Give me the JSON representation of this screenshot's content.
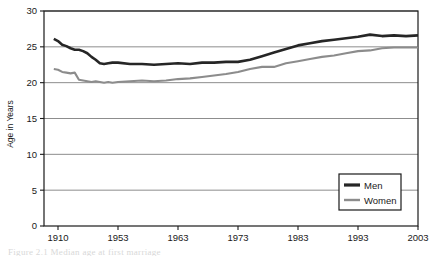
{
  "figure": {
    "background": "#ffffff",
    "caption_partial": "Figure 2.1  Median age at first marriage"
  },
  "chart_data": {
    "type": "line",
    "title": "",
    "subtitle": "",
    "xlabel": "",
    "ylabel": "Age in Years",
    "ylim": [
      0,
      30
    ],
    "yticks": [
      0,
      5,
      10,
      15,
      20,
      25,
      30
    ],
    "ytick_labels": [
      "0",
      "5",
      "10",
      "15",
      "20",
      "25",
      "30"
    ],
    "xticks": [
      1910,
      1953,
      1963,
      1973,
      1983,
      1993,
      2003
    ],
    "xtick_labels": [
      "1910",
      "1953",
      "1963",
      "1973",
      "1983",
      "1993",
      "2003"
    ],
    "xlim": [
      1907,
      2003
    ],
    "grid": "horizontal",
    "legend_position": "bottom-right",
    "colors": {
      "men": "#262626",
      "women": "#8c8c8c",
      "axis": "#1a1a1a",
      "gridline": "#808080",
      "plot_border": "#1a1a1a"
    },
    "x": [
      1907,
      1910,
      1913,
      1916,
      1919,
      1922,
      1925,
      1928,
      1931,
      1934,
      1937,
      1940,
      1943,
      1946,
      1949,
      1953,
      1955,
      1957,
      1959,
      1961,
      1963,
      1965,
      1967,
      1969,
      1971,
      1973,
      1975,
      1977,
      1979,
      1981,
      1983,
      1985,
      1987,
      1989,
      1991,
      1993,
      1995,
      1997,
      1999,
      2001,
      2003
    ],
    "series": [
      {
        "name": "Men",
        "color": "#262626",
        "line_width": 2.6,
        "values": [
          26.1,
          25.8,
          25.3,
          25.1,
          24.8,
          24.6,
          24.6,
          24.4,
          24.1,
          23.6,
          23.2,
          22.7,
          22.6,
          22.7,
          22.8,
          22.8,
          22.6,
          22.6,
          22.5,
          22.6,
          22.7,
          22.6,
          22.8,
          22.8,
          22.9,
          22.9,
          23.2,
          23.7,
          24.2,
          24.7,
          25.2,
          25.5,
          25.8,
          26.0,
          26.2,
          26.4,
          26.7,
          26.5,
          26.6,
          26.5,
          26.6
        ]
      },
      {
        "name": "Women",
        "color": "#8c8c8c",
        "line_width": 2.1,
        "values": [
          21.9,
          21.8,
          21.5,
          21.4,
          21.3,
          21.4,
          20.4,
          20.3,
          20.2,
          20.1,
          20.2,
          20.1,
          20.0,
          20.1,
          20.0,
          20.1,
          20.2,
          20.3,
          20.2,
          20.3,
          20.5,
          20.6,
          20.8,
          21.0,
          21.2,
          21.5,
          21.9,
          22.2,
          22.2,
          22.7,
          23.0,
          23.3,
          23.6,
          23.8,
          24.1,
          24.4,
          24.5,
          24.8,
          24.9,
          24.9,
          24.9
        ]
      }
    ]
  },
  "legend": {
    "entries": [
      {
        "label": "Men",
        "color": "#262626",
        "line_width": 3.2
      },
      {
        "label": "Women",
        "color": "#8c8c8c",
        "line_width": 2.4
      }
    ]
  }
}
